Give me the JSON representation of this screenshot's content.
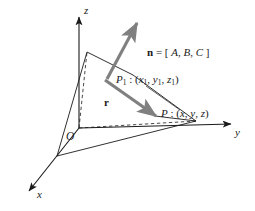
{
  "figure": {
    "kind": "3d-vector-plane-diagram",
    "background_color": "#ffffff",
    "line_color": "#1a1a1a",
    "vector_color": "#808080",
    "axes": {
      "z_label": "z",
      "y_label": "y",
      "x_label": "x",
      "origin_label": "O"
    },
    "vectors": [
      {
        "name": "normal-vector",
        "label_plain": "n = [ A, B, C ]",
        "symbol": "n",
        "equals": " = [ ",
        "components": [
          "A",
          "B",
          "C"
        ],
        "close": " ]",
        "separator": ", ",
        "color": "#808080"
      },
      {
        "name": "position-vector",
        "label_plain": "r",
        "symbol": "r",
        "color": "#808080"
      }
    ],
    "points": [
      {
        "name": "point-p1",
        "label_plain": "P1 : (x1, y1, z1)",
        "symbol": "P",
        "sub": "1",
        "colon": " : (",
        "coords": [
          "x",
          "y",
          "z"
        ],
        "coord_sub": "1",
        "close": ")"
      },
      {
        "name": "point-p",
        "label_plain": "P : (x, y, z)",
        "symbol": "P",
        "colon": " : (",
        "coords": [
          "x",
          "y",
          "z"
        ],
        "close": ")"
      }
    ]
  }
}
